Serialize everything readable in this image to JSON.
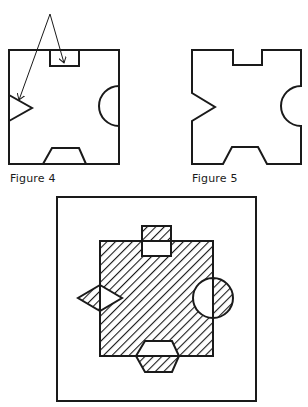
{
  "figures": [
    {
      "id": "figure-4",
      "caption": "Figure 4",
      "description": "Square with a rectangular notch at top, triangular notch at left, semicircular notch at right, trapezoidal notch at bottom; two arrows from a common point point at the top and left notches"
    },
    {
      "id": "figure-5",
      "caption": "Figure 5",
      "description": "Outline of the same shape with notches cut out (puzzle-piece-like outline)"
    },
    {
      "id": "figure-6",
      "caption": "",
      "description": "Framed hatched square with protruding hatched tabs; notched regions shown white"
    }
  ],
  "colors": {
    "stroke": "#1a1a1a",
    "background": "#ffffff",
    "hatch": "#1a1a1a"
  }
}
